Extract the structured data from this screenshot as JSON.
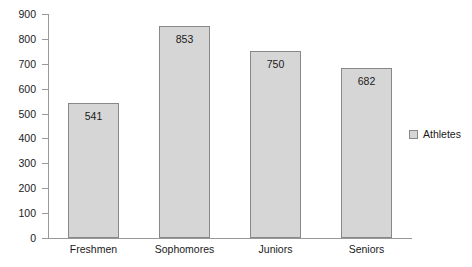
{
  "chart_data": {
    "type": "bar",
    "title": "",
    "xlabel": "",
    "ylabel": "",
    "categories": [
      "Freshmen",
      "Sophomores",
      "Juniors",
      "Seniors"
    ],
    "values": [
      541,
      853,
      750,
      682
    ],
    "series": [
      {
        "name": "Athletes",
        "values": [
          541,
          853,
          750,
          682
        ]
      }
    ],
    "ylim": [
      0,
      900
    ],
    "y_ticks": [
      0,
      100,
      200,
      300,
      400,
      500,
      600,
      700,
      800,
      900
    ],
    "y_tick_labels": [
      "0",
      "100",
      "200",
      "300",
      "400",
      "500",
      "600",
      "700",
      "800",
      "900"
    ],
    "data_labels": [
      "541",
      "853",
      "750",
      "682"
    ],
    "grid": false,
    "legend": {
      "position": "right",
      "entries": [
        {
          "label": "Athletes",
          "color": "#d6d6d6"
        }
      ]
    },
    "colors": {
      "bar_fill": "#d6d6d6",
      "bar_border": "#888888",
      "axis": "#999999",
      "text": "#1a1a1a",
      "background": "#ffffff"
    }
  }
}
